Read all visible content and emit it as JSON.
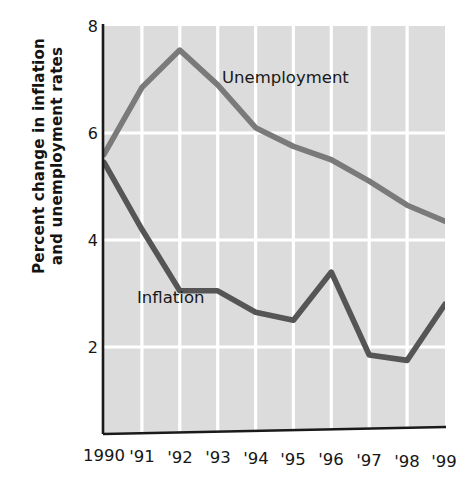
{
  "chart_data": {
    "type": "line",
    "title": "",
    "xlabel": "",
    "ylabel": "Percent change in inflation and unemployment rates",
    "ylabel_line1": "Percent change in inflation",
    "ylabel_line2": "and unemployment rates",
    "categories": [
      "1990",
      "'91",
      "'92",
      "'93",
      "'94",
      "'95",
      "'96",
      "'97",
      "'98",
      "'99"
    ],
    "x": [
      1990,
      1991,
      1992,
      1993,
      1994,
      1995,
      1996,
      1997,
      1998,
      1999
    ],
    "xtick_labels": [
      "1990",
      "'91",
      "'92",
      "'93",
      "'94",
      "'95",
      "'96",
      "'97",
      "'98",
      "'99"
    ],
    "ytick_labels": [
      "8",
      "6",
      "4",
      "2"
    ],
    "yticks": [
      8,
      6,
      4,
      2
    ],
    "ylim": [
      0.4,
      8.0
    ],
    "xlim": [
      1990,
      1999
    ],
    "grid": true,
    "grid_color": "#ffffff",
    "plot_background": "#dcdcdc",
    "legend_position": "inline-annotation",
    "series": [
      {
        "name": "Unemployment",
        "color": "#7a7a7a",
        "values": [
          5.6,
          6.85,
          7.55,
          6.9,
          6.1,
          5.75,
          5.5,
          5.1,
          4.65,
          4.35
        ]
      },
      {
        "name": "Inflation",
        "color": "#555555",
        "values": [
          5.45,
          4.2,
          3.05,
          3.05,
          2.65,
          2.5,
          3.4,
          1.85,
          1.75,
          2.8
        ]
      }
    ],
    "annotations": [
      {
        "text": "Unemployment",
        "series": "Unemployment"
      },
      {
        "text": "Inflation",
        "series": "Inflation"
      }
    ]
  },
  "axis": {
    "y_title_line1": "Percent change in inflation",
    "y_title_line2": "and unemployment rates",
    "y_ticks": [
      "8",
      "6",
      "4",
      "2"
    ],
    "x_ticks": [
      "1990",
      "'91",
      "'92",
      "'93",
      "'94",
      "'95",
      "'96",
      "'97",
      "'98",
      "'99"
    ]
  },
  "labels": {
    "unemployment": "Unemployment",
    "inflation": "Inflation"
  },
  "colors": {
    "unemployment_line": "#7a7a7a",
    "inflation_line": "#555555",
    "plot_bg": "#dcdcdc",
    "grid": "#ffffff",
    "axis": "#1a1a1a",
    "text": "#161616"
  }
}
